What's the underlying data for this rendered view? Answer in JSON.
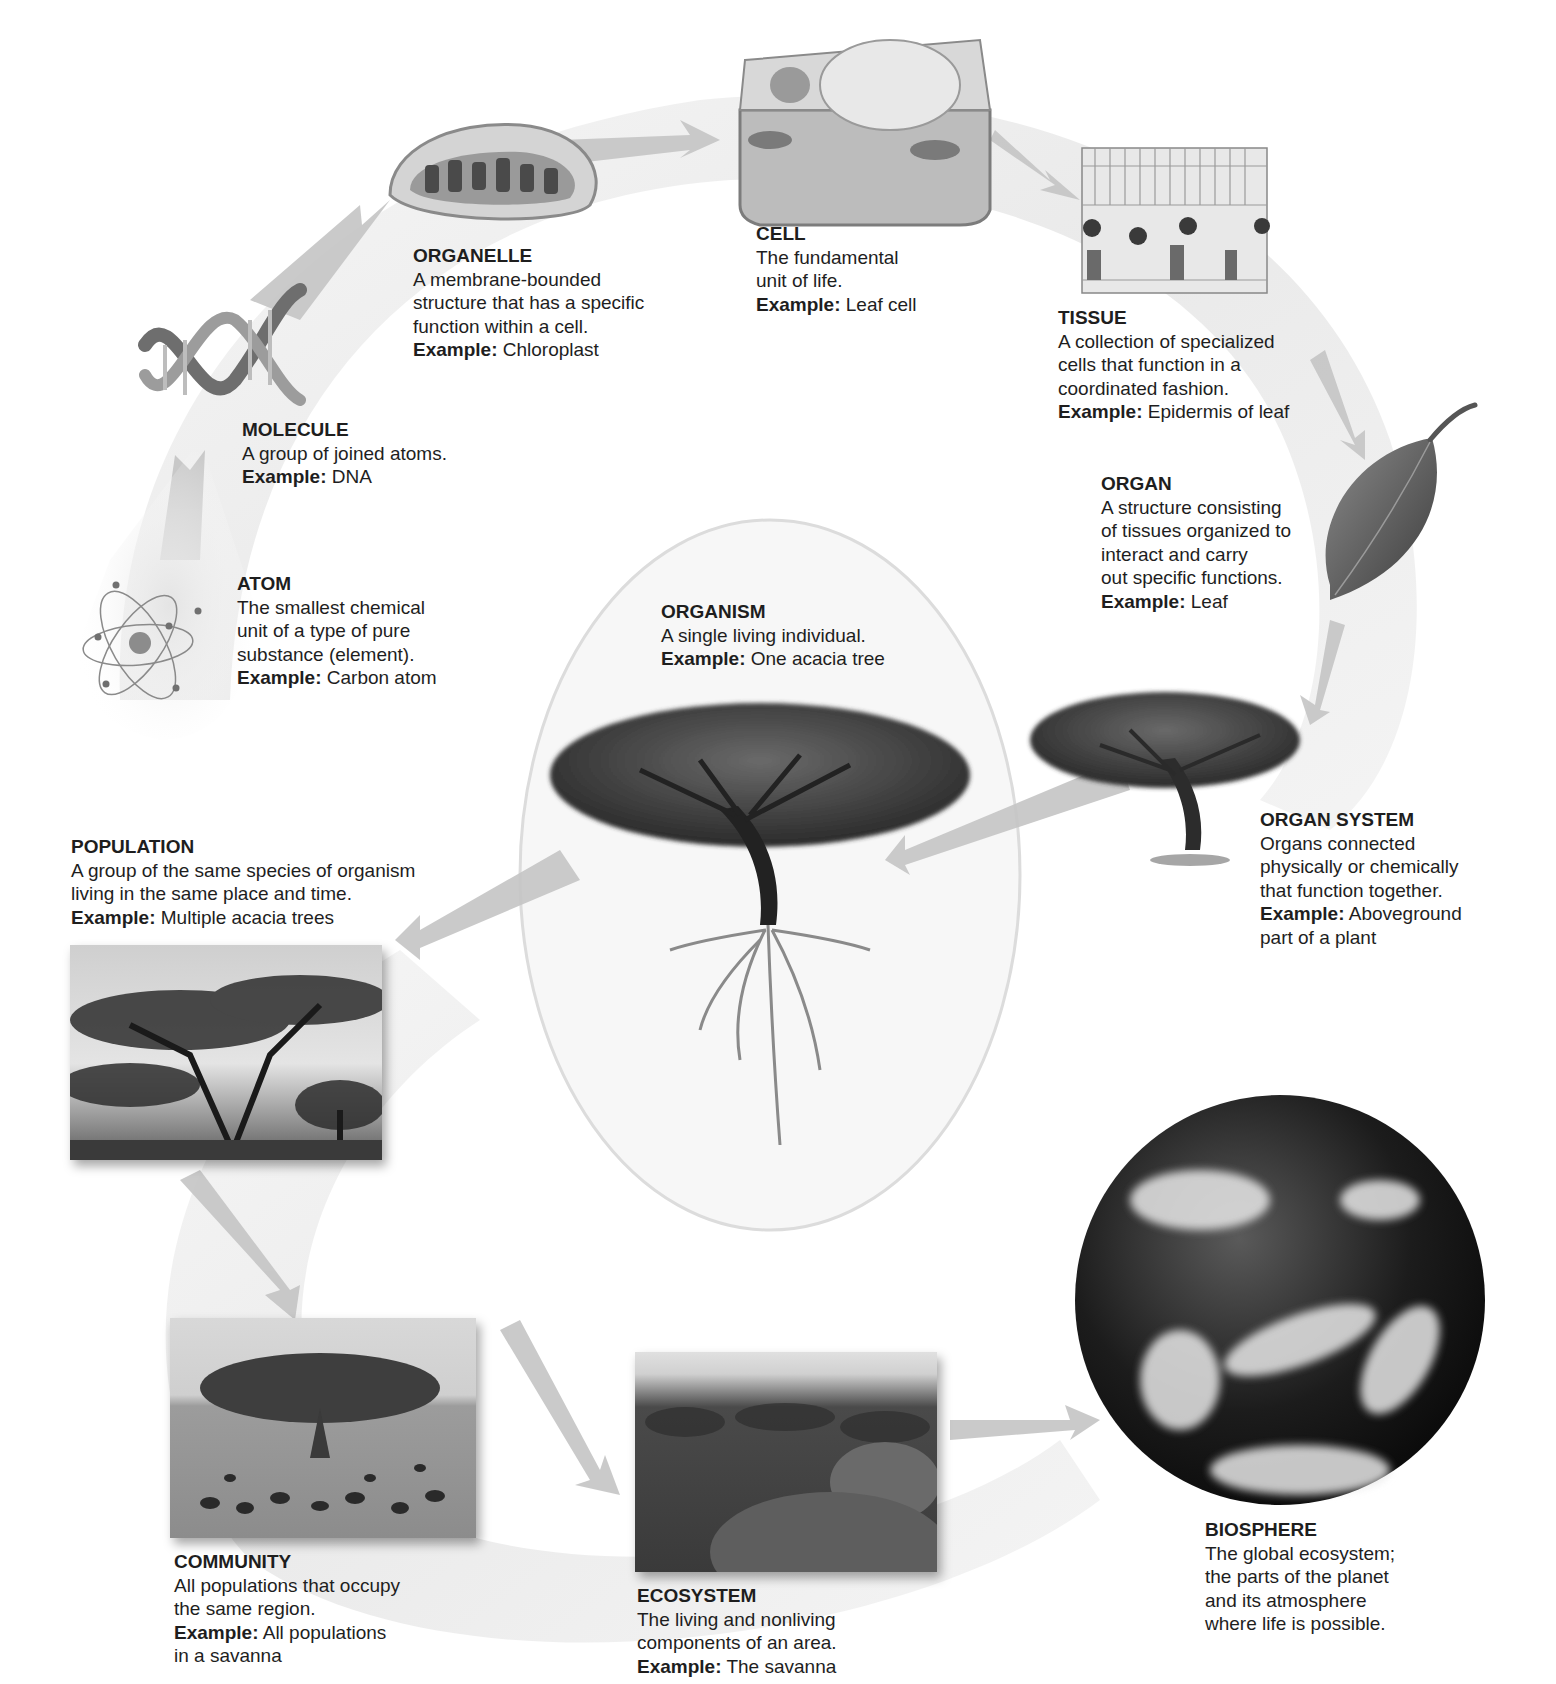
{
  "figure": {
    "colors": {
      "arrow": "#c8c8c8",
      "band": "#ececec",
      "text": "#1e1e1e",
      "background": "#ffffff"
    }
  },
  "levels": [
    {
      "id": "atom",
      "title": "ATOM",
      "lines": [
        "The smallest chemical",
        "unit of a type of pure",
        "substance (element)."
      ],
      "example_key": "Example:",
      "example_value": "Carbon atom",
      "example_lines": [],
      "icon": "atom-icon"
    },
    {
      "id": "molecule",
      "title": "MOLECULE",
      "lines": [
        "A group of joined atoms."
      ],
      "example_key": "Example:",
      "example_value": "DNA",
      "example_lines": [],
      "icon": "dna-icon"
    },
    {
      "id": "organelle",
      "title": "ORGANELLE",
      "lines": [
        "A membrane-bounded",
        "structure that has a specific",
        "function within a cell."
      ],
      "example_key": "Example:",
      "example_value": "Chloroplast",
      "example_lines": [],
      "icon": "chloroplast-icon"
    },
    {
      "id": "cell",
      "title": "CELL",
      "lines": [
        "The fundamental",
        "unit of life."
      ],
      "example_key": "Example:",
      "example_value": "Leaf cell",
      "example_lines": [],
      "icon": "plant-cell-icon"
    },
    {
      "id": "tissue",
      "title": "TISSUE",
      "lines": [
        "A collection of specialized",
        "cells that function in a",
        "coordinated fashion."
      ],
      "example_key": "Example:",
      "example_value": "Epidermis of leaf",
      "example_lines": [],
      "icon": "leaf-tissue-icon"
    },
    {
      "id": "organ",
      "title": "ORGAN",
      "lines": [
        "A structure consisting",
        "of tissues organized to",
        "interact and carry",
        "out specific functions."
      ],
      "example_key": "Example:",
      "example_value": "Leaf",
      "example_lines": [],
      "icon": "leaf-icon"
    },
    {
      "id": "organ_system",
      "title": "ORGAN SYSTEM",
      "lines": [
        "Organs connected",
        "physically or chemically",
        "that function together."
      ],
      "example_key": "Example:",
      "example_value": "Aboveground",
      "example_lines": [
        "part of a plant"
      ],
      "icon": "tree-icon"
    },
    {
      "id": "organism",
      "title": "ORGANISM",
      "lines": [
        "A single living individual."
      ],
      "example_key": "Example:",
      "example_value": "One acacia tree",
      "example_lines": [],
      "icon": "tree-with-roots-icon"
    },
    {
      "id": "population",
      "title": "POPULATION",
      "lines": [
        "A group of the same species of organism",
        "living in the same place and time."
      ],
      "example_key": "Example:",
      "example_value": "Multiple acacia trees",
      "example_lines": [],
      "icon": "acacia-trees-photo"
    },
    {
      "id": "community",
      "title": "COMMUNITY",
      "lines": [
        "All populations that occupy",
        "the same region."
      ],
      "example_key": "Example:",
      "example_value": "All populations",
      "example_lines": [
        "in a savanna"
      ],
      "icon": "savanna-animals-photo"
    },
    {
      "id": "ecosystem",
      "title": "ECOSYSTEM",
      "lines": [
        "The living and nonliving",
        "components of an area."
      ],
      "example_key": "Example:",
      "example_value": "The savanna",
      "example_lines": [],
      "icon": "savanna-landscape-photo"
    },
    {
      "id": "biosphere",
      "title": "BIOSPHERE",
      "lines": [
        "The global ecosystem;",
        "the parts of the planet",
        "and its atmosphere",
        "where life is possible."
      ],
      "example_key": "",
      "example_value": "",
      "example_lines": [],
      "icon": "earth-globe-icon"
    }
  ]
}
